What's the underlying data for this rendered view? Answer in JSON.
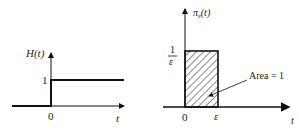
{
  "left_plot": {
    "y_label": "H(t)",
    "level_label": "1",
    "origin_label": "0",
    "x_label": "t"
  },
  "right_plot": {
    "y_label_main": "π",
    "y_label_sub": "ε",
    "y_label_arg": "(t)",
    "height_numerator": "1",
    "height_denominator": "ε",
    "origin_label": "0",
    "width_label": "ε",
    "x_label": "t",
    "annotation": "Area = 1"
  },
  "colors": {
    "line": "#111111",
    "background": "#ffffff"
  }
}
